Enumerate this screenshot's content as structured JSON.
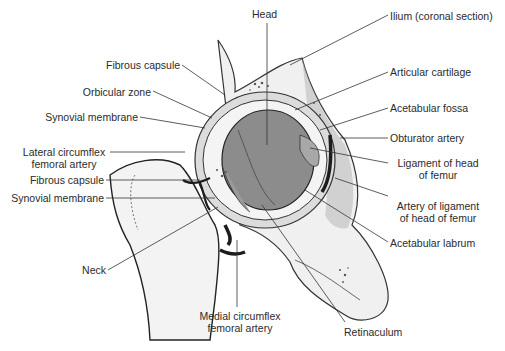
{
  "figure": {
    "labels": {
      "head": "Head",
      "ilium": "Ilium (coronal section)",
      "fibrous_capsule_top": "Fibrous capsule",
      "articular_cartilage": "Articular cartilage",
      "orbicular_zone": "Orbicular zone",
      "acetabular_fossa": "Acetabular fossa",
      "synovial_membrane_top": "Synovial membrane",
      "obturator_artery": "Obturator artery",
      "lateral_circumflex_1": "Lateral circumflex",
      "lateral_circumflex_2": "femoral artery",
      "ligament_head_1": "Ligament of head",
      "ligament_head_2": "of femur",
      "fibrous_capsule_bottom": "Fibrous capsule",
      "synovial_membrane_bottom": "Synovial membrane",
      "artery_ligament_1": "Artery of ligament",
      "artery_ligament_2": "of head of femur",
      "acetabular_labrum": "Acetabular labrum",
      "neck": "Neck",
      "medial_circumflex_1": "Medial circumflex",
      "medial_circumflex_2": "femoral artery",
      "retinaculum": "Retinaculum"
    },
    "colors": {
      "bone_fill": "#f2f2f2",
      "head_fill": "#8a8a8a",
      "shade": "#b5b5b5",
      "artery": "#1c1c1c",
      "line": "#333333"
    }
  }
}
